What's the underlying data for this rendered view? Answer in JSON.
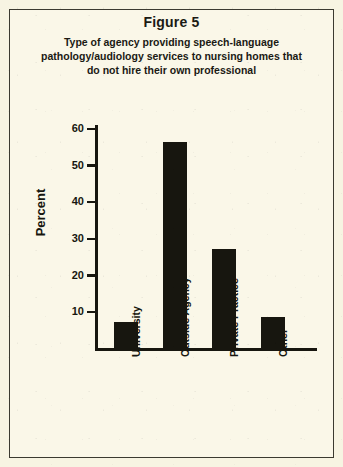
{
  "figure": {
    "number_label": "Figure 5",
    "caption_line_1": "Type of agency providing speech-language",
    "caption_line_2": "pathology/audiology services to nursing homes that",
    "caption_line_3": "do not hire their own professional"
  },
  "colors": {
    "background": "#faf7e8",
    "ink": "#17160f",
    "border": "#3b3a30",
    "bar_fill": "#17160f"
  },
  "axis": {
    "y_title": "Percent",
    "y_ticks": [
      "10",
      "20",
      "30",
      "40",
      "50",
      "60"
    ]
  },
  "chart_data": {
    "type": "bar",
    "title": "Figure 5",
    "subtitle": "Type of agency providing speech-language pathology/audiology services to nursing homes that do not hire their own professional",
    "categories": [
      "University",
      "Outside Agency",
      "Private Practice",
      "Other"
    ],
    "values": [
      7,
      56,
      27,
      8.5
    ],
    "xlabel": "",
    "ylabel": "Percent",
    "ylim": [
      0,
      60
    ],
    "ytick_step": 10,
    "ytick_values": [
      10,
      20,
      30,
      40,
      50,
      60
    ],
    "grid": false,
    "legend": false,
    "orientation": "vertical",
    "bar_color": "#17160f",
    "value_unit": "percent"
  }
}
